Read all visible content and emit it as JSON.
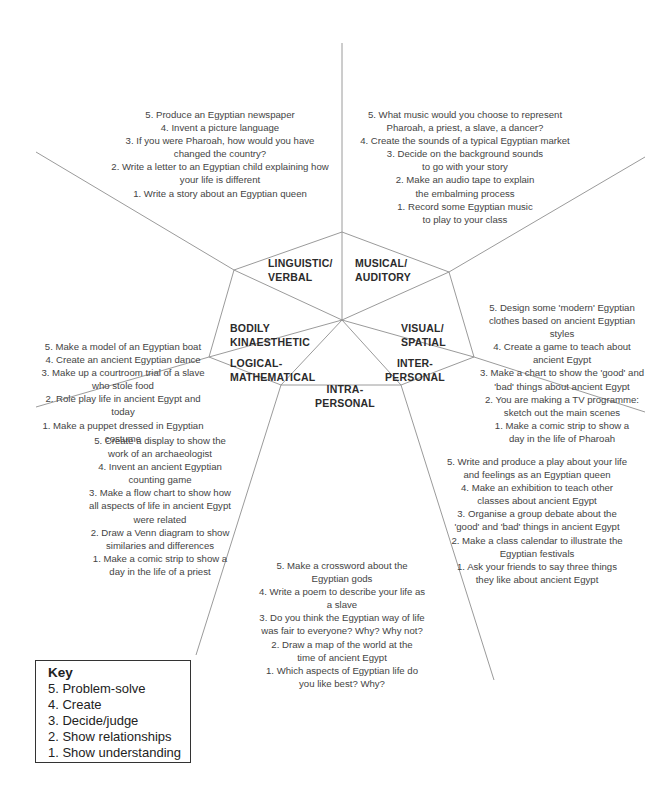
{
  "diagram": {
    "type": "multiple-intelligences-wheel",
    "topic": "Ancient Egypt",
    "sections": {
      "linguistic": {
        "label_line1": "LINGUISTIC/",
        "label_line2": "VERBAL",
        "items": [
          "5. Produce an Egyptian newspaper",
          "4. Invent a picture language",
          "3. If you were Pharoah, how would you have changed the country?",
          "2. Write a letter to an Egyptian child explaining how your life is different",
          "1. Write a story about an Egyptian queen"
        ]
      },
      "musical": {
        "label_line1": "MUSICAL/",
        "label_line2": "AUDITORY",
        "items": [
          "5. What music would you choose to represent Pharoah, a priest, a slave, a dancer?",
          "4. Create the sounds of a typical Egyptian market",
          "3. Decide on the background sounds to go with your story",
          "2. Make an audio tape to explain the embalming process",
          "1. Record some Egyptian music to play to your class"
        ]
      },
      "visual": {
        "label_line1": "VISUAL/",
        "label_line2": "SPATIAL",
        "items": [
          "5. Design some 'modern' Egyptian clothes based on ancient Egyptian styles",
          "4. Create a game to teach about ancient Egypt",
          "3. Make a chart to show the 'good' and 'bad' things about ancient Egypt",
          "2. You are making a TV programme: sketch out the main scenes",
          "1. Make a comic strip to show a day in the life of Pharoah"
        ]
      },
      "interpersonal": {
        "label_line1": "INTER-",
        "label_line2": "PERSONAL",
        "items": [
          "5. Write and produce a play about your life and feelings as an Egyptian queen",
          "4. Make an exhibition to teach other classes about ancient Egypt",
          "3. Organise a group debate about the 'good' and 'bad' things in ancient Egypt",
          "2. Make a class calendar to illustrate the Egyptian festivals",
          "1. Ask your friends to say three things they like about ancient Egypt"
        ]
      },
      "intrapersonal": {
        "label_line1": "INTRA-",
        "label_line2": "PERSONAL",
        "items": [
          "5. Make a crossword about the Egyptian gods",
          "4. Write a poem to describe your life as a slave",
          "3. Do you think the Egyptian way of life was fair to everyone? Why? Why not?",
          "2. Draw a map of the world at the time of ancient Egypt",
          "1. Which aspects of Egyptian life do you like best? Why?"
        ]
      },
      "logical": {
        "label_line1": "LOGICAL-",
        "label_line2": "MATHEMATICAL",
        "items": [
          "5. Create a display to show the work of an archaeologist",
          "4. Invent an ancient Egyptian counting game",
          "3. Make a flow chart to show how all aspects of life in ancient Egypt were related",
          "2. Draw a Venn diagram to show similaries and differences",
          "1. Make a comic strip to show a day in the life of a priest"
        ]
      },
      "bodily": {
        "label_line1": "BODILY",
        "label_line2": "KINAESTHETIC",
        "items": [
          "5. Make a model of an Egyptian boat",
          "4. Create an ancient Egyptian dance",
          "3. Make up a courtroom trial of a slave who stole food",
          "2. Role play life in ancient Egypt and today",
          "1. Make a puppet dressed in Egyptian costume"
        ]
      }
    },
    "key": {
      "title": "Key",
      "items": [
        "5. Problem-solve",
        "4. Create",
        "3. Decide/judge",
        "2. Show relationships",
        "1. Show understanding"
      ]
    },
    "colors": {
      "line": "#8a8a8a",
      "text": "#444444",
      "label": "#2b2b2b",
      "background": "#ffffff"
    }
  }
}
